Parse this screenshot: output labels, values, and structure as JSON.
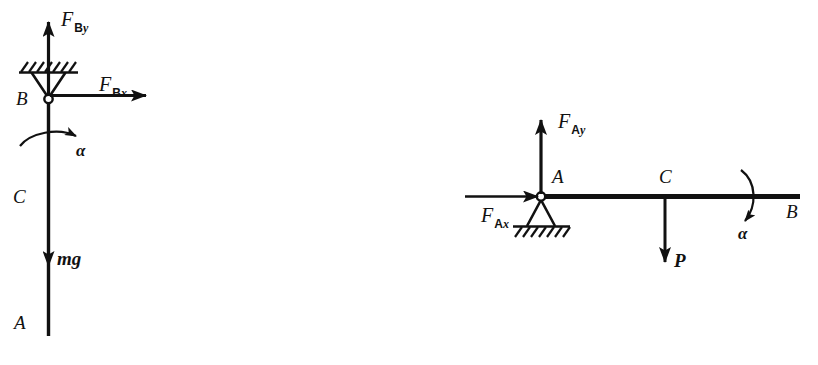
{
  "figure": {
    "background_color": "#ffffff",
    "ink_color": "#111111",
    "width": 818,
    "height": 365
  },
  "diagrams": [
    {
      "id": "left-diagram",
      "name": "vertical-rod-free-body-diagram",
      "description": "Vertical rod hinged at top point B, center of gravity C, free end A at bottom",
      "members": [
        {
          "name": "rod-AB",
          "orientation": "vertical",
          "top_point": "B",
          "bottom_point": "A"
        }
      ],
      "support": {
        "name": "pin-support-B",
        "type": "pin",
        "position": "top",
        "hatching": "above-ground-line",
        "triangle_direction": "down"
      },
      "points": [
        {
          "label": "B",
          "name": "point-label-B",
          "role": "pin joint at top"
        },
        {
          "label": "C",
          "name": "point-label-C",
          "role": "center of gravity"
        },
        {
          "label": "A",
          "name": "point-label-A",
          "role": "free end at bottom"
        }
      ],
      "forces": [
        {
          "name": "force-F-By",
          "symbol": "F",
          "subscript": "By",
          "subscript_roman": "B",
          "subscript_italic": "y",
          "direction": "up",
          "applied_at": "B"
        },
        {
          "name": "force-F-Bx",
          "symbol": "F",
          "subscript": "Bx",
          "subscript_roman": "B",
          "subscript_italic": "x",
          "direction": "right",
          "applied_at": "B"
        },
        {
          "name": "force-weight-mg",
          "symbol": "mg",
          "direction": "down",
          "applied_at": "C"
        }
      ],
      "angular_acceleration": {
        "name": "angular-acceleration-alpha",
        "symbol": "α",
        "sense": "counterclockwise-arc-pointing-up-right"
      }
    },
    {
      "id": "right-diagram",
      "name": "horizontal-beam-free-body-diagram",
      "description": "Horizontal beam pinned at left end A, load P at midpoint C, free end B at right",
      "members": [
        {
          "name": "beam-AB",
          "orientation": "horizontal",
          "left_point": "A",
          "right_point": "B"
        }
      ],
      "support": {
        "name": "pin-support-A",
        "type": "pin",
        "position": "left-end",
        "hatching": "below-ground-line",
        "triangle_direction": "up"
      },
      "points": [
        {
          "label": "A",
          "name": "point-label-A",
          "role": "pin joint at left end"
        },
        {
          "label": "C",
          "name": "point-label-C",
          "role": "load application point"
        },
        {
          "label": "B",
          "name": "point-label-B",
          "role": "free end at right"
        }
      ],
      "forces": [
        {
          "name": "force-F-Ay",
          "symbol": "F",
          "subscript": "Ay",
          "subscript_roman": "A",
          "subscript_italic": "y",
          "direction": "up",
          "applied_at": "A"
        },
        {
          "name": "force-F-Ax",
          "symbol": "F",
          "subscript": "Ax",
          "subscript_roman": "A",
          "subscript_italic": "x",
          "direction": "right",
          "applied_at": "A"
        },
        {
          "name": "force-load-P",
          "symbol": "P",
          "direction": "down",
          "applied_at": "C"
        }
      ],
      "angular_acceleration": {
        "name": "angular-acceleration-alpha",
        "symbol": "α",
        "sense": "clockwise-arc-pointing-down-left"
      }
    }
  ]
}
